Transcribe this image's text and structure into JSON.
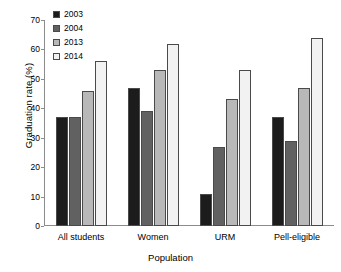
{
  "chart_data": {
    "type": "bar",
    "title": "",
    "xlabel": "Population",
    "ylabel": "Graduation rate (%)",
    "categories": [
      "All students",
      "Women",
      "URM",
      "Pell-eligible"
    ],
    "ylim": [
      0,
      70
    ],
    "yticks": [
      0,
      10,
      20,
      30,
      40,
      50,
      60,
      70
    ],
    "grid": false,
    "legend_position": "top-left",
    "series": [
      {
        "name": "2003",
        "color": "#1c1c1c",
        "values": [
          37,
          47,
          11,
          37
        ]
      },
      {
        "name": "2004",
        "color": "#616161",
        "values": [
          37,
          39,
          27,
          29
        ]
      },
      {
        "name": "2013",
        "color": "#b8b8b8",
        "values": [
          46,
          53,
          43,
          47
        ]
      },
      {
        "name": "2014",
        "color": "#f2f2f2",
        "values": [
          56,
          62,
          53,
          64
        ]
      }
    ]
  }
}
